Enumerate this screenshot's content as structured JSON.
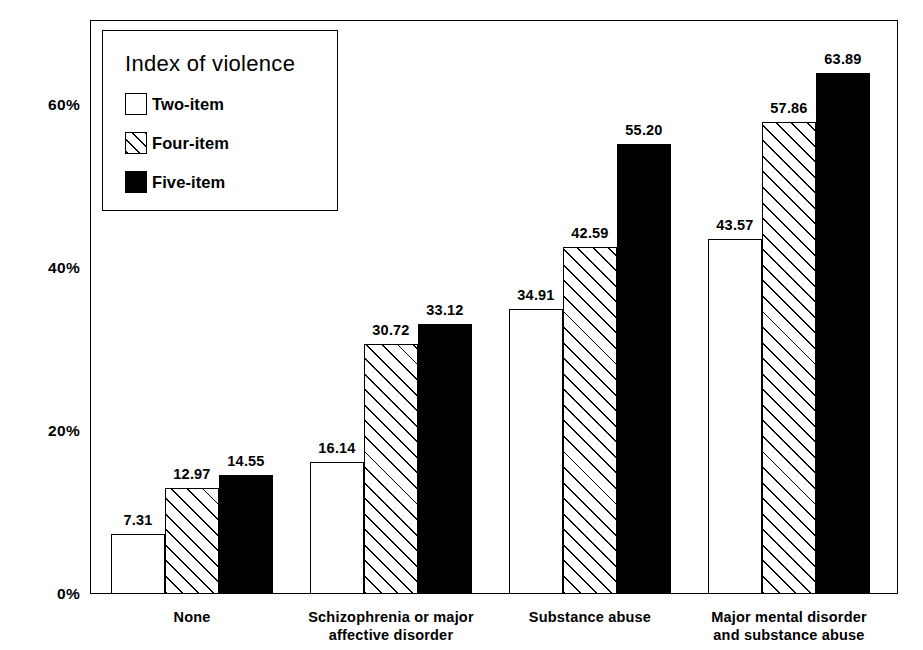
{
  "chart_data": {
    "type": "bar",
    "title": "",
    "xlabel": "",
    "ylabel": "Percent violent",
    "ylim": [
      0,
      70
    ],
    "grid": false,
    "legend_position": "top-left",
    "legend_title": "Index of violence",
    "categories": [
      "None",
      "Schizophrenia or major\naffective disorder",
      "Substance abuse",
      "Major mental disorder\nand substance abuse"
    ],
    "y_ticks": [
      "0%",
      "20%",
      "40%",
      "60%"
    ],
    "y_tick_values": [
      0,
      20,
      40,
      60
    ],
    "series": [
      {
        "name": "Two-item",
        "fill": "white",
        "values": [
          7.31,
          16.14,
          34.91,
          43.57
        ],
        "labels": [
          "7.31",
          "16.14",
          "34.91",
          "43.57"
        ]
      },
      {
        "name": "Four-item",
        "fill": "hatched",
        "values": [
          12.97,
          30.72,
          42.59,
          57.86
        ],
        "labels": [
          "12.97",
          "30.72",
          "42.59",
          "57.86"
        ]
      },
      {
        "name": "Five-item",
        "fill": "black",
        "values": [
          14.55,
          33.12,
          55.2,
          63.89
        ],
        "labels": [
          "14.55",
          "33.12",
          "55.20",
          "63.89"
        ]
      }
    ],
    "colors": {
      "two_item": "#ffffff",
      "four_item": "#ffffff",
      "five_item": "#000000",
      "outline": "#000000",
      "background": "#ffffff"
    }
  },
  "axis": {
    "y_title": "Percent violent",
    "ticks": [
      {
        "label": "60%",
        "value": 60
      },
      {
        "label": "40%",
        "value": 40
      },
      {
        "label": "20%",
        "value": 20
      },
      {
        "label": "0%",
        "value": 0
      }
    ]
  },
  "legend": {
    "title": "Index of violence",
    "items": [
      {
        "label": "Two-item",
        "swatch": "white-square-icon"
      },
      {
        "label": "Four-item",
        "swatch": "hatched-square-icon"
      },
      {
        "label": "Five-item",
        "swatch": "black-square-icon"
      }
    ]
  }
}
